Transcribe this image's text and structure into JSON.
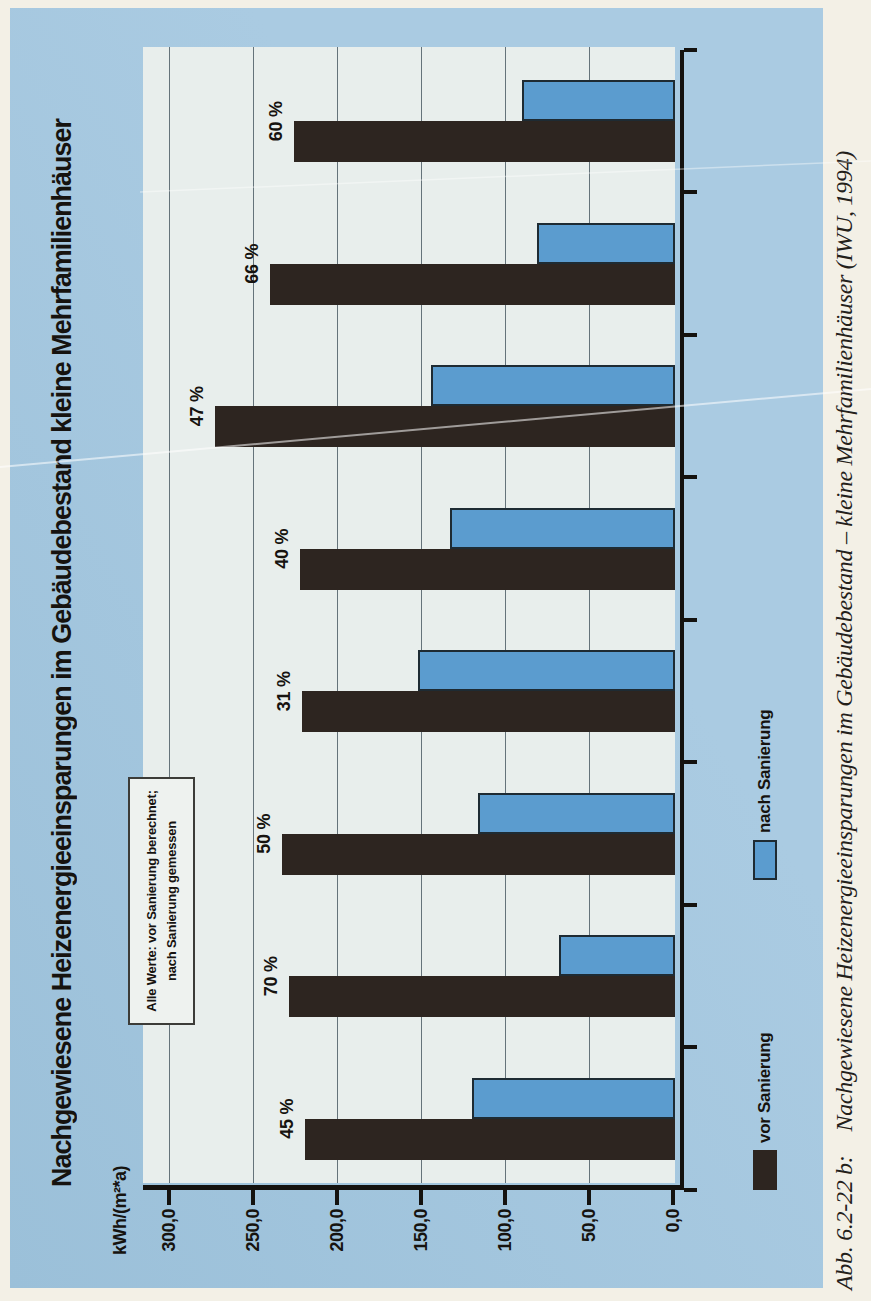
{
  "figure": {
    "title": "Nachgewiesene Heizenergieeinsparungen im Gebäudebestand kleine Mehrfamilienhäuser",
    "axis_unit": "kWh/(m²*a)",
    "note_line1": "Alle Werte: vor Sanierung berechnet;",
    "note_line2": "nach Sanierung gemessen",
    "caption_prefix": "Abb. 6.2-22 b:",
    "caption_text": "Nachgewiesene Heizenergieeinsparungen im Gebäudebestand – kleine Mehrfamilienhäuser (IWU, 1994)"
  },
  "legend": {
    "vor": "vor Sanierung",
    "nach": "nach Sanierung"
  },
  "colors": {
    "paper": "#f3f0e6",
    "blue": "#aacbe2",
    "blue_dark": "#9bc0d9",
    "plot_bg": "#e8eeec",
    "bar_vor": "#2d2520",
    "bar_nach": "#5b9ccf",
    "nach_border": "#1e2b33",
    "grid": "#4d5d66",
    "axis": "#14120f",
    "ink": "#16130f",
    "note_bg": "#eef2ef",
    "frame": "#111111"
  },
  "chart_data": {
    "type": "bar",
    "title": "Nachgewiesene Heizenergieeinsparungen im Gebäudebestand kleine Mehrfamilienhäuser",
    "note": "Alle Werte: vor Sanierung berechnet; nach Sanierung gemessen",
    "orientation": "vertical bars; whole figure printed rotated 90° counter-clockwise on the page",
    "categories": [
      "45 %",
      "70 %",
      "50 %",
      "31 %",
      "40 %",
      "47 %",
      "66 %",
      "60 %"
    ],
    "savings_percent_labels": [
      "45 %",
      "70 %",
      "50 %",
      "31 %",
      "40 %",
      "47 %",
      "66 %",
      "60 %"
    ],
    "series": [
      {
        "name": "vor Sanierung",
        "values": [
          220,
          230,
          234,
          222,
          223,
          274,
          241,
          227
        ]
      },
      {
        "name": "nach Sanierung",
        "values": [
          121,
          69,
          117,
          153,
          134,
          145,
          82,
          91
        ]
      }
    ],
    "xlabel": "",
    "ylabel": "kWh/(m²*a)",
    "ylim": [
      0,
      300
    ],
    "ytick_values": [
      300,
      250,
      200,
      150,
      100,
      50,
      0
    ],
    "ytick_labels": [
      "300,0",
      "250,0",
      "200,0",
      "150,0",
      "100,0",
      "50,0",
      "0,0"
    ],
    "grid": "horizontal gridlines at 50-unit steps",
    "legend_position": "bottom"
  }
}
